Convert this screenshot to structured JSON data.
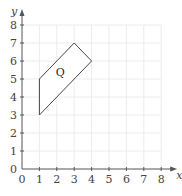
{
  "chart_data": {
    "type": "scatter",
    "title": "",
    "xlabel": "x",
    "ylabel": "y",
    "xlim": [
      0,
      8
    ],
    "ylim": [
      0,
      8
    ],
    "xticks": [
      0,
      1,
      2,
      3,
      4,
      5,
      6,
      7,
      8
    ],
    "yticks": [
      0,
      1,
      2,
      3,
      4,
      5,
      6,
      7,
      8
    ],
    "grid": true,
    "shapes": [
      {
        "name": "Q",
        "label": "Q",
        "vertices": [
          [
            1,
            3
          ],
          [
            1,
            5
          ],
          [
            3,
            7
          ],
          [
            4,
            6
          ]
        ],
        "label_position": [
          2.2,
          5.4
        ]
      }
    ]
  },
  "colors": {
    "grid": "#ececec",
    "axis": "#555555",
    "shape_stroke": "#444444",
    "shape_fill": "#ffffff"
  }
}
